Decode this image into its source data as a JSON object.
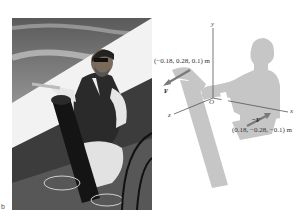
{
  "figure": {
    "part_label": "b",
    "photo": {
      "description": "Illustration of a sailor in a vest and sunglasses cranking a winch on a sailboat deck, with coiled rope, under a cloudy sky"
    },
    "diagram": {
      "axes": {
        "x_label": "x",
        "y_label": "y",
        "z_label": "z",
        "origin_label": "O"
      },
      "forces": [
        {
          "name": "F",
          "label": "F",
          "point_label": "(−0.18, 0.28, 0.1) m"
        },
        {
          "name": "-F",
          "label": "−F",
          "point_label": "(0.18, −0.28, −0.1) m"
        }
      ],
      "colors": {
        "silhouette": "#c4c4c4",
        "arrow": "#7a7a7a",
        "axis": "#555555",
        "text": "#333333"
      }
    }
  }
}
